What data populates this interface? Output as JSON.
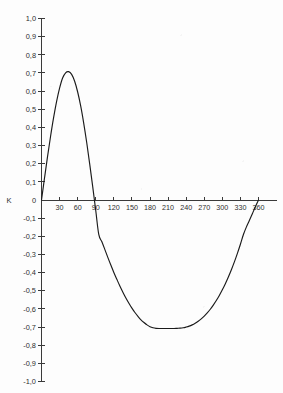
{
  "chart_data": {
    "type": "line",
    "title": "",
    "subtitle": "",
    "xlabel": "",
    "ylabel": "K",
    "axis_name": "K",
    "decimal_separator": ",",
    "grid": false,
    "legend": "none",
    "line_color": "#1b1b1b",
    "axis_color": "#3a3a3a",
    "background_color": "#fdfdfd",
    "xlim": [
      0,
      360
    ],
    "ylim": [
      -1.0,
      1.0
    ],
    "x_ticks": [
      0,
      30,
      60,
      90,
      120,
      150,
      180,
      210,
      240,
      270,
      300,
      330,
      360
    ],
    "x_tick_labels": [
      "",
      "30",
      "60",
      "90",
      "120",
      "150",
      "180",
      "210",
      "240",
      "270",
      "300",
      "330",
      "360"
    ],
    "y_ticks": [
      1.0,
      0.9,
      0.8,
      0.7,
      0.6,
      0.5,
      0.4,
      0.3,
      0.2,
      0.1,
      0,
      -0.1,
      -0.2,
      -0.3,
      -0.4,
      -0.5,
      -0.6,
      -0.7,
      -0.8,
      -0.9,
      -1.0
    ],
    "y_tick_labels": [
      "1,0",
      "0,9",
      "0,8",
      "0,7",
      "0,6",
      "0,5",
      "0,4",
      "0,3",
      "0,2",
      "0,1",
      "0",
      "-0,1",
      "-0,2",
      "-0,3",
      "-0,4",
      "-0,5",
      "-0,6",
      "-0,7",
      "-0,8",
      "-0,9",
      "-1,0"
    ],
    "annotations": {
      "maximum": {
        "x": 45,
        "y": 0.707
      },
      "minimum": {
        "x": 225,
        "y": -0.707
      },
      "zero_crossings": [
        0,
        90,
        360
      ]
    },
    "series": [
      {
        "name": "K",
        "x": [
          0,
          5,
          10,
          15,
          20,
          25,
          30,
          35,
          40,
          45,
          50,
          55,
          60,
          65,
          70,
          75,
          80,
          85,
          90,
          95,
          100,
          105,
          110,
          115,
          120,
          125,
          130,
          135,
          140,
          145,
          150,
          155,
          160,
          165,
          170,
          175,
          180,
          185,
          190,
          195,
          200,
          205,
          210,
          215,
          220,
          225,
          230,
          235,
          240,
          245,
          250,
          255,
          260,
          265,
          270,
          275,
          280,
          285,
          290,
          295,
          300,
          305,
          310,
          315,
          320,
          325,
          330,
          335,
          340,
          345,
          350,
          355,
          360
        ],
        "y": [
          0,
          0.121,
          0.239,
          0.35,
          0.452,
          0.542,
          0.616,
          0.672,
          0.701,
          0.707,
          0.692,
          0.654,
          0.595,
          0.518,
          0.424,
          0.317,
          0.198,
          0.072,
          -0.058,
          -0.19,
          -0.229,
          -0.272,
          -0.316,
          -0.358,
          -0.399,
          -0.437,
          -0.474,
          -0.508,
          -0.54,
          -0.569,
          -0.596,
          -0.62,
          -0.641,
          -0.66,
          -0.675,
          -0.688,
          -0.698,
          -0.704,
          -0.707,
          -0.708,
          -0.708,
          -0.708,
          -0.708,
          -0.708,
          -0.708,
          -0.707,
          -0.706,
          -0.704,
          -0.7,
          -0.695,
          -0.688,
          -0.679,
          -0.668,
          -0.655,
          -0.64,
          -0.622,
          -0.602,
          -0.579,
          -0.554,
          -0.526,
          -0.495,
          -0.461,
          -0.424,
          -0.384,
          -0.341,
          -0.294,
          -0.244,
          -0.19,
          -0.148,
          -0.112,
          -0.074,
          -0.036,
          0
        ]
      }
    ]
  }
}
